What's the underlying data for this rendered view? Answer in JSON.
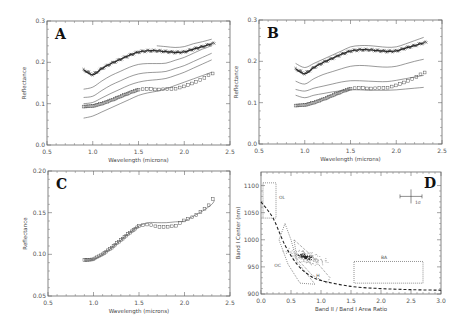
{
  "figure": {
    "panels": [
      {
        "id": "A",
        "label": "A",
        "xlabel": "Wavelength (microns)",
        "ylabel": "Reflectance",
        "xticks": [
          "0.5",
          "1.0",
          "1.5",
          "2.0",
          "2.5"
        ],
        "yticks": [
          "0.0",
          "0.1",
          "0.2",
          "0.3"
        ]
      },
      {
        "id": "B",
        "label": "B",
        "xlabel": "Wavelength (microns)",
        "ylabel": "Reflectance",
        "xticks": [
          "0.5",
          "1.0",
          "1.5",
          "2.0",
          "2.5"
        ],
        "yticks": [
          "0.0",
          "0.1",
          "0.2",
          "0.3"
        ]
      },
      {
        "id": "C",
        "label": "C",
        "xlabel": "Wavelength (microns)",
        "ylabel": "Reflectance",
        "xticks": [
          "0.5",
          "1.0",
          "1.5",
          "2.0",
          "2.5"
        ],
        "yticks": [
          "0.05",
          "0.10",
          "0.15",
          "0.20"
        ]
      },
      {
        "id": "D",
        "label": "D",
        "xlabel": "Band II / Band I Area Ratio",
        "ylabel": "Band I Center (nm)",
        "xticks": [
          "0.0",
          "0.5",
          "1.0",
          "1.5",
          "2.0",
          "2.5",
          "3.0"
        ],
        "yticks": [
          "900",
          "950",
          "1000",
          "1050",
          "1100"
        ],
        "region_labels": [
          "OL",
          "OC",
          "H",
          "BA"
        ],
        "error_label": "1σ"
      }
    ]
  },
  "chart_data": [
    {
      "type": "line",
      "title": "A",
      "xlabel": "Wavelength (microns)",
      "ylabel": "Reflectance",
      "xlim": [
        0.5,
        2.5
      ],
      "ylim": [
        0.0,
        0.3
      ],
      "x": [
        0.9,
        1.0,
        1.1,
        1.2,
        1.3,
        1.4,
        1.5,
        1.6,
        1.7,
        1.8,
        1.9,
        2.0,
        2.1,
        2.2,
        2.3
      ],
      "series": [
        {
          "name": "measured (upper, crosses)",
          "values": [
            0.182,
            0.17,
            0.185,
            0.197,
            0.207,
            0.217,
            0.225,
            0.228,
            0.228,
            0.226,
            0.224,
            0.225,
            0.232,
            0.238,
            0.245
          ]
        },
        {
          "name": "model 1",
          "values": [
            null,
            null,
            null,
            null,
            null,
            null,
            null,
            null,
            null,
            null,
            null,
            null,
            null,
            null,
            0.255
          ]
        },
        {
          "name": "model 2",
          "values": [
            0.135,
            0.14,
            0.155,
            0.168,
            0.178,
            0.188,
            0.195,
            0.197,
            0.197,
            0.198,
            0.205,
            0.212,
            0.222,
            0.232,
            0.24
          ]
        },
        {
          "name": "model 3",
          "values": [
            0.115,
            0.118,
            0.132,
            0.145,
            0.155,
            0.165,
            0.172,
            0.175,
            0.176,
            0.178,
            0.185,
            0.192,
            0.202,
            0.212,
            0.222
          ]
        },
        {
          "name": "model 4",
          "values": [
            0.1,
            0.103,
            0.114,
            0.125,
            0.135,
            0.145,
            0.152,
            0.156,
            0.158,
            0.161,
            0.168,
            0.176,
            0.186,
            0.196,
            0.206
          ]
        },
        {
          "name": "measured (lower, squares)",
          "values": [
            0.093,
            0.094,
            0.1,
            0.108,
            0.117,
            0.126,
            0.134,
            0.136,
            0.134,
            0.135,
            0.136,
            0.142,
            0.15,
            0.16,
            0.173
          ]
        },
        {
          "name": "model 5",
          "values": [
            0.065,
            0.07,
            0.08,
            0.09,
            0.1,
            0.11,
            0.12,
            0.126,
            0.13,
            0.136,
            0.144,
            0.152,
            0.16,
            0.168,
            0.176
          ]
        }
      ]
    },
    {
      "type": "line",
      "title": "B",
      "xlabel": "Wavelength (microns)",
      "ylabel": "Reflectance",
      "xlim": [
        0.5,
        2.5
      ],
      "ylim": [
        0.0,
        0.3
      ],
      "x": [
        0.9,
        1.0,
        1.1,
        1.2,
        1.3,
        1.4,
        1.5,
        1.6,
        1.7,
        1.8,
        1.9,
        2.0,
        2.1,
        2.2,
        2.3
      ],
      "series": [
        {
          "name": "measured (upper, crosses)",
          "values": [
            0.182,
            0.17,
            0.185,
            0.197,
            0.207,
            0.217,
            0.225,
            0.228,
            0.228,
            0.226,
            0.224,
            0.225,
            0.232,
            0.238,
            0.245
          ]
        },
        {
          "name": "model 1",
          "values": [
            0.195,
            0.185,
            0.195,
            0.205,
            0.215,
            0.225,
            0.235,
            0.238,
            0.238,
            0.236,
            0.234,
            0.235,
            0.242,
            0.25,
            0.258
          ]
        },
        {
          "name": "model 2",
          "values": [
            0.152,
            0.145,
            0.158,
            0.168,
            0.175,
            0.182,
            0.188,
            0.19,
            0.189,
            0.187,
            0.186,
            0.188,
            0.194,
            0.2,
            0.205
          ]
        },
        {
          "name": "model 3",
          "values": [
            0.132,
            0.128,
            0.135,
            0.14,
            0.145,
            0.15,
            0.153,
            0.153,
            0.152,
            0.151,
            0.151,
            0.154,
            0.158,
            0.162,
            0.166
          ]
        },
        {
          "name": "measured (lower, squares)",
          "values": [
            0.093,
            0.094,
            0.1,
            0.108,
            0.117,
            0.126,
            0.134,
            0.136,
            0.134,
            0.135,
            0.136,
            0.142,
            0.15,
            0.16,
            0.173
          ]
        },
        {
          "name": "model 4",
          "values": [
            0.118,
            0.112,
            0.118,
            0.122,
            0.126,
            0.129,
            0.131,
            0.131,
            0.13,
            0.13,
            0.13,
            0.131,
            0.133,
            0.135,
            0.137
          ]
        }
      ]
    },
    {
      "type": "line",
      "title": "C",
      "xlabel": "Wavelength (microns)",
      "ylabel": "Reflectance",
      "xlim": [
        0.5,
        2.5
      ],
      "ylim": [
        0.05,
        0.2
      ],
      "x": [
        0.9,
        1.0,
        1.1,
        1.2,
        1.3,
        1.4,
        1.5,
        1.6,
        1.7,
        1.8,
        1.9,
        2.0,
        2.1,
        2.2,
        2.3,
        2.33
      ],
      "series": [
        {
          "name": "measured (squares)",
          "values": [
            0.093,
            0.094,
            0.1,
            0.108,
            0.117,
            0.126,
            0.134,
            0.136,
            0.133,
            0.133,
            0.134,
            0.141,
            0.145,
            0.153,
            0.162,
            0.175
          ]
        },
        {
          "name": "model fit",
          "values": [
            0.093,
            0.094,
            0.1,
            0.108,
            0.117,
            0.126,
            0.134,
            0.138,
            0.138,
            0.138,
            0.139,
            0.14,
            0.146,
            0.152,
            0.16,
            0.165
          ]
        }
      ]
    },
    {
      "type": "scatter",
      "title": "D",
      "xlabel": "Band II / Band I Area Ratio",
      "ylabel": "Band I Center (nm)",
      "xlim": [
        0.0,
        3.0
      ],
      "ylim": [
        900,
        1125
      ],
      "regions": [
        {
          "name": "OL",
          "x": [
            0.0,
            0.25
          ],
          "y": [
            1040,
            1105
          ]
        },
        {
          "name": "BA",
          "x": [
            1.55,
            2.7
          ],
          "y": [
            920,
            960
          ]
        },
        {
          "name": "OC",
          "poly": [
            [
              0.4,
              1030
            ],
            [
              0.3,
              1000
            ],
            [
              0.45,
              955
            ],
            [
              0.65,
              920
            ],
            [
              0.9,
              918
            ],
            [
              0.6,
              960
            ],
            [
              0.5,
              1000
            ]
          ]
        },
        {
          "name": "H",
          "poly": [
            [
              0.55,
              1000
            ],
            [
              0.8,
              975
            ],
            [
              1.15,
              930
            ],
            [
              1.1,
              920
            ],
            [
              0.85,
              935
            ],
            [
              0.6,
              965
            ]
          ]
        }
      ],
      "trend_curve_dashed": {
        "x": [
          0.0,
          0.2,
          0.4,
          0.6,
          0.8,
          1.0,
          1.5,
          2.0,
          2.5,
          3.0
        ],
        "y": [
          1070,
          1040,
          990,
          955,
          935,
          925,
          914,
          910,
          908,
          907
        ]
      },
      "point_cluster": {
        "center": [
          0.75,
          968
        ],
        "spread": [
          0.25,
          15
        ]
      },
      "error_bar": {
        "x": 2.5,
        "y": 1080,
        "label": "1σ"
      }
    }
  ]
}
